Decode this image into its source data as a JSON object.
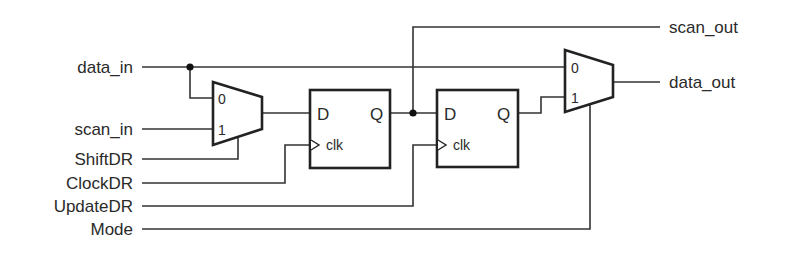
{
  "diagram": {
    "type": "boundary-scan-cell-schematic",
    "inputs": [
      {
        "id": "data_in",
        "label": "data_in"
      },
      {
        "id": "scan_in",
        "label": "scan_in"
      },
      {
        "id": "shift_dr",
        "label": "ShiftDR"
      },
      {
        "id": "clock_dr",
        "label": "ClockDR"
      },
      {
        "id": "update_dr",
        "label": "UpdateDR"
      },
      {
        "id": "mode",
        "label": "Mode"
      }
    ],
    "outputs": [
      {
        "id": "scan_out",
        "label": "scan_out"
      },
      {
        "id": "data_out",
        "label": "data_out"
      }
    ],
    "mux1": {
      "pin0": "0",
      "pin1": "1"
    },
    "ff1": {
      "d": "D",
      "q": "Q",
      "clk": "clk"
    },
    "ff2": {
      "d": "D",
      "q": "Q",
      "clk": "clk"
    },
    "mux2": {
      "pin0": "0",
      "pin1": "1"
    },
    "colors": {
      "line": "#333333",
      "background": "#ffffff"
    }
  }
}
